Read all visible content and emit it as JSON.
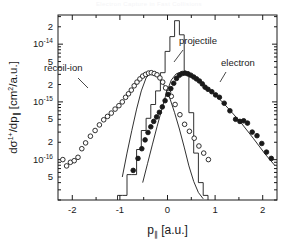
{
  "figure": {
    "header_watermark": "Electron Capture in Fast Collisions",
    "background_color": "#ffffff",
    "ink_color": "#1a1a1a"
  },
  "chart_data": {
    "type": "scatter",
    "title": "",
    "subtitle": "",
    "xlabel": "p∥  [a.u.]",
    "ylabel": "dσ¹⁺/dp∥  [cm²/a.u.]",
    "xlabel_parts": {
      "symbol": "p",
      "subscript": "∥",
      "units": "[a.u.]"
    },
    "ylabel_parts": {
      "numerator": "dσ",
      "numerator_superscript": "1+",
      "denominator": "/dp",
      "denominator_subscript": "∥",
      "units": "[cm",
      "units_superscript": "2",
      "units_tail": "/a.u.]"
    },
    "xlim": [
      -2.3,
      2.3
    ],
    "ylim": [
      2e-17,
      3.2e-14
    ],
    "yscale": "log",
    "grid": false,
    "legend_position": "inline-annotations",
    "xticks": [
      -2,
      -1,
      0,
      1,
      2
    ],
    "xticklabels": [
      "-2",
      "-1",
      "0",
      "1",
      "2"
    ],
    "xminorticks": [
      -2.0,
      -1.5,
      -1.0,
      -0.5,
      0.0,
      0.5,
      1.0,
      1.5,
      2.0
    ],
    "yticks": [
      2e-14,
      1e-14,
      5e-15,
      2e-15,
      1e-15,
      5e-16,
      2e-16,
      1e-16,
      5e-17
    ],
    "yticklabels": [
      "2",
      "10",
      "5",
      "2",
      "10",
      "5",
      "2",
      "10",
      "5"
    ],
    "ytick_exponents": [
      "",
      "-14",
      "",
      "",
      "-15",
      "",
      "",
      "-16",
      ""
    ],
    "annotations": [
      {
        "text": "recoil-ion",
        "x_px": 44,
        "y_px": 71,
        "leader_from_px": [
          78,
          78
        ],
        "leader_to_px": [
          88,
          88
        ]
      },
      {
        "text": "projectile",
        "x_px": 179,
        "y_px": 44,
        "leader_from_px": [
          183,
          50
        ],
        "leader_to_px": [
          174,
          62
        ]
      },
      {
        "text": "electron",
        "x_px": 221,
        "y_px": 66,
        "leader_from_px": [
          226,
          72
        ],
        "leader_to_px": [
          220,
          82
        ]
      }
    ],
    "series": [
      {
        "name": "recoil-ion",
        "label": "recoil-ion",
        "marker": "open-circle",
        "marker_color": "#ffffff",
        "edge_color": "#1a1a1a",
        "x": [
          -2.2,
          -2.12,
          -2.04,
          -1.96,
          -1.88,
          -1.8,
          -1.72,
          -1.62,
          -1.52,
          -1.43,
          -1.34,
          -1.26,
          -1.18,
          -1.1,
          -1.02,
          -0.95,
          -0.88,
          -0.82,
          -0.76,
          -0.7,
          -0.64,
          -0.58,
          -0.52,
          -0.46,
          -0.4,
          -0.34,
          -0.28,
          -0.22,
          -0.16,
          -0.1,
          -0.04,
          0.02,
          0.08,
          0.16,
          0.26,
          0.36,
          0.46,
          0.56,
          0.66,
          0.76,
          0.86
        ],
        "y": [
          1e-16,
          7.8e-17,
          9e-17,
          9.6e-17,
          1.1e-16,
          1.55e-16,
          1.95e-16,
          2.55e-16,
          3.2e-16,
          4e-16,
          4.9e-16,
          5.6e-16,
          6.4e-16,
          7.5e-16,
          8.6e-16,
          1e-15,
          1.2e-15,
          1.38e-15,
          1.6e-15,
          1.9e-15,
          2.2e-15,
          2.5e-15,
          2.8e-15,
          3e-15,
          3.15e-15,
          3.2e-15,
          3.1e-15,
          2.95e-15,
          2.6e-15,
          2.2e-15,
          1.75e-15,
          1.45e-15,
          1.25e-15,
          9e-16,
          6e-16,
          4.1e-16,
          3.1e-16,
          2.35e-16,
          1.72e-16,
          1.3e-16,
          1e-16
        ]
      },
      {
        "name": "electron",
        "label": "electron",
        "marker": "filled-circle",
        "marker_color": "#1a1a1a",
        "edge_color": "#1a1a1a",
        "x": [
          -0.72,
          -0.62,
          -0.54,
          -0.47,
          -0.41,
          -0.35,
          -0.29,
          -0.23,
          -0.17,
          -0.11,
          -0.05,
          0.01,
          0.07,
          0.13,
          0.19,
          0.25,
          0.31,
          0.37,
          0.43,
          0.49,
          0.55,
          0.61,
          0.67,
          0.73,
          0.79,
          0.85,
          0.93,
          1.01,
          1.09,
          1.19,
          1.31,
          1.43,
          1.52,
          1.6,
          1.68,
          1.78,
          1.88,
          1.98,
          2.08,
          2.18
        ],
        "y": [
          6.5e-17,
          1.05e-16,
          1.55e-16,
          2.2e-16,
          2.95e-16,
          3.7e-16,
          4.6e-16,
          5.5e-16,
          6.6e-16,
          8.2e-16,
          1.05e-15,
          1.35e-15,
          1.7e-15,
          2.1e-15,
          2.55e-15,
          2.9e-15,
          3.1e-15,
          3.15e-15,
          3.05e-15,
          2.9e-15,
          2.7e-15,
          2.5e-15,
          2.3e-15,
          2.05e-15,
          1.8e-15,
          1.65e-15,
          1.5e-15,
          1.32e-15,
          1.2e-15,
          9.5e-16,
          7e-16,
          5e-16,
          4.6e-16,
          4.7e-16,
          4.3e-16,
          3e-16,
          2.6e-16,
          1.9e-16,
          1.35e-16,
          1.05e-16
        ]
      },
      {
        "name": "projectile",
        "label": "projectile",
        "marker": "histogram",
        "line_color": "#1a1a1a",
        "bin_edges": [
          -1.05,
          -0.95,
          -0.85,
          -0.75,
          -0.65,
          -0.55,
          -0.45,
          -0.35,
          -0.25,
          -0.15,
          -0.05,
          0.05,
          0.15,
          0.25,
          0.35,
          0.45,
          0.55,
          0.65,
          0.75,
          0.85
        ],
        "values": [
          2.4e-17,
          2.4e-17,
          5.5e-17,
          5.5e-17,
          1.5e-16,
          3.2e-16,
          5.2e-16,
          9e-16,
          1.55e-15,
          3.2e-15,
          7.5e-15,
          1.35e-14,
          2.55e-14,
          1.45e-14,
          3.3e-15,
          6.5e-16,
          1.3e-16,
          4e-17,
          2.4e-17
        ]
      },
      {
        "name": "recoil-ion-theory",
        "label": "",
        "marker": "line",
        "line_color": "#1a1a1a",
        "x": [
          -1.05,
          -0.95,
          -0.85,
          -0.75,
          -0.65,
          -0.55,
          -0.45,
          -0.35,
          -0.25,
          -0.15,
          -0.05,
          0.05,
          0.15,
          0.25,
          0.35,
          0.45,
          0.55,
          0.65,
          0.75,
          0.82
        ],
        "y": [
          1.9e-17,
          5e-17,
          1.3e-16,
          3.2e-16,
          7.5e-16,
          1.55e-15,
          2.6e-15,
          3.15e-15,
          3.1e-15,
          2.55e-15,
          1.8e-15,
          1.15e-15,
          6.5e-16,
          3.4e-16,
          1.65e-16,
          7.8e-17,
          4.2e-17,
          2.7e-17,
          2.1e-17,
          1.9e-17
        ]
      },
      {
        "name": "electron-theory",
        "label": "",
        "marker": "line",
        "line_color": "#1a1a1a",
        "x": [
          -0.62,
          -0.52,
          -0.42,
          -0.32,
          -0.22,
          -0.12,
          -0.02,
          0.08,
          0.18,
          0.28,
          0.38,
          0.48,
          0.58,
          0.7,
          0.85,
          1.0,
          1.15,
          1.35,
          1.55,
          1.8,
          2.05,
          2.25
        ],
        "y": [
          1.9e-17,
          4e-17,
          8.5e-17,
          1.8e-16,
          3.7e-16,
          7.5e-16,
          1.45e-15,
          2.4e-15,
          3.05e-15,
          3.3e-15,
          3.2e-15,
          2.95e-15,
          2.65e-15,
          2.25e-15,
          1.75e-15,
          1.32e-15,
          1e-15,
          6.6e-16,
          4.3e-16,
          2.35e-16,
          1.25e-16,
          8e-17
        ]
      }
    ]
  }
}
